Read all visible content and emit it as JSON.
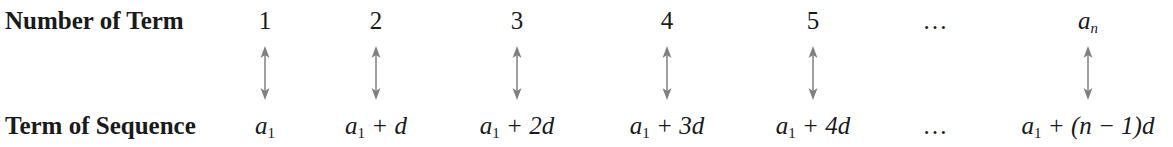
{
  "rows": {
    "top_label": "Number of Term",
    "bottom_label": "Term of Sequence"
  },
  "columns": [
    {
      "x": 265,
      "number": "1",
      "term_var": "a",
      "term_sub": "1",
      "term_rest": ""
    },
    {
      "x": 376,
      "number": "2",
      "term_var": "a",
      "term_sub": "1",
      "term_rest": " + d"
    },
    {
      "x": 517,
      "number": "3",
      "term_var": "a",
      "term_sub": "1",
      "term_rest": " + 2d"
    },
    {
      "x": 667,
      "number": "4",
      "term_var": "a",
      "term_sub": "1",
      "term_rest": " + 3d"
    },
    {
      "x": 813,
      "number": "5",
      "term_var": "a",
      "term_sub": "1",
      "term_rest": " + 4d"
    },
    {
      "x": 935,
      "number": "…",
      "term_text": "…"
    },
    {
      "x": 1088,
      "number_var": "a",
      "number_sub": "n",
      "term_var": "a",
      "term_sub": "1",
      "term_rest": " + (n − 1)d"
    }
  ],
  "arrow_color": "#808080",
  "arrow_columns": [
    265,
    376,
    517,
    667,
    813,
    1088
  ]
}
